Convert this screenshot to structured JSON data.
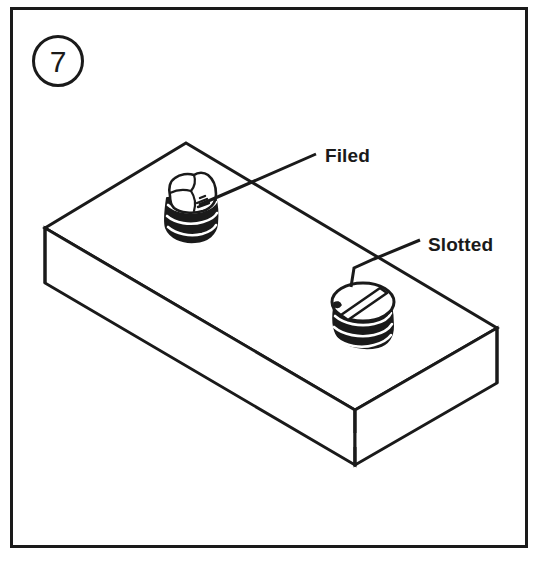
{
  "figure": {
    "step_number": "7",
    "frame": {
      "x": 10,
      "y": 7,
      "width": 518,
      "height": 541,
      "stroke_width": 3,
      "color": "#1a1a1a"
    },
    "background_color": "#ffffff",
    "ink_color": "#1a1a1a",
    "step_badge": {
      "center_x": 58,
      "center_y": 61,
      "radius": 25,
      "stroke_width": 3
    }
  },
  "callouts": [
    {
      "id": "filed",
      "label": "Filed",
      "text_x": 325,
      "text_y": 162,
      "leader_points": "199,205 236,189 316,154",
      "crossing_leader_points": "236,189 310,222"
    },
    {
      "id": "slotted",
      "label": "Slotted",
      "text_x": 428,
      "text_y": 251,
      "leader_points": "351,287 354,268 374,259 420,240",
      "crossing_leader_points": "374,259 446,292"
    }
  ],
  "block": {
    "description": "rectangular metal block in isometric view",
    "top_face": "186,143 497,328 355,410 45,228",
    "left_face": "45,228 355,410 355,465 45,283",
    "right_face": "355,410 497,328 497,383 355,465",
    "front_corner_break": {
      "x": 355,
      "y_top": 432,
      "y_bottom": 447
    }
  },
  "fasteners": [
    {
      "id": "filed-screw",
      "label_ref": "filed",
      "type": "filed-off screw head",
      "center_x": 190,
      "center_y": 208,
      "thread_bands": 3
    },
    {
      "id": "slotted-screw",
      "label_ref": "slotted",
      "type": "slotted screw head",
      "center_x": 362,
      "center_y": 313,
      "thread_bands": 3
    }
  ]
}
